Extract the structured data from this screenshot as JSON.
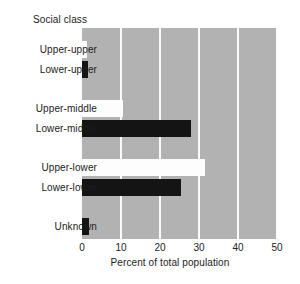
{
  "chart_data": {
    "type": "bar",
    "orientation": "horizontal",
    "title": "",
    "group_title": "Social class",
    "xlabel": "Percent of total population",
    "ylabel": "",
    "xlim": [
      0,
      50
    ],
    "xticks": [
      0,
      10,
      20,
      30,
      40,
      50
    ],
    "xtick_labels": [
      "0",
      "10",
      "20",
      "30",
      "40",
      "50"
    ],
    "grid": true,
    "grid_orientation": "vertical",
    "legend": "none",
    "plot_background": "#b2b2b2",
    "gridline_color": "#fbfbfb",
    "categories": [
      "Upper-upper",
      "Lower-upper",
      "Upper-middle",
      "Lower-middle",
      "Upper-lower",
      "Lower-lower",
      "Unknown"
    ],
    "values": [
      1.4,
      1.6,
      10.5,
      28.0,
      31.5,
      25.5,
      1.7
    ],
    "bar_colors": [
      "#fdfdfd",
      "#141414",
      "#fdfdfd",
      "#141414",
      "#fdfdfd",
      "#141414",
      "#141414"
    ],
    "bar_fill_names": [
      "white",
      "black",
      "white",
      "black",
      "white",
      "black",
      "black"
    ]
  },
  "axis": {
    "xlabel": "Percent of total population",
    "ticks": [
      "0",
      "10",
      "20",
      "30",
      "40",
      "50"
    ]
  },
  "labels": {
    "group_title": "Social class",
    "categories": [
      "Upper-upper",
      "Lower-upper",
      "Upper-middle",
      "Lower-middle",
      "Upper-lower",
      "Lower-lower",
      "Unknown"
    ]
  },
  "caption_fragment": ""
}
